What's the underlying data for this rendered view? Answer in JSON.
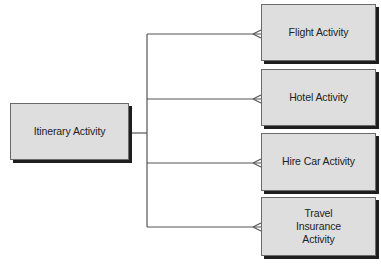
{
  "diagram": {
    "type": "entity-relationship",
    "parent": {
      "label": "Itinerary Activity"
    },
    "children": [
      {
        "label": "Flight Activity"
      },
      {
        "label": "Hotel Activity"
      },
      {
        "label": "Hire Car Activity"
      },
      {
        "label": "Travel Insurance Activity"
      }
    ],
    "relationship": "one-to-many (crow's foot)"
  }
}
